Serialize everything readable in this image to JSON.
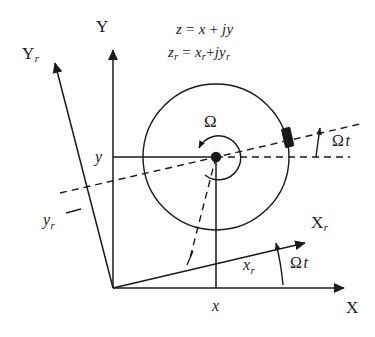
{
  "figure": {
    "background_color": "#ffffff",
    "stroke_color": "#1a1a1a",
    "equations": {
      "line1": {
        "lhs": "z",
        "eq": "=",
        "rhs_real": "x",
        "plus": "+",
        "rhs_imag": "jy"
      },
      "line2": {
        "lhs": "z",
        "lhs_sub": "r",
        "eq": "=",
        "rhs_real": "x",
        "rhs_real_sub": "r",
        "plus": "+",
        "rhs_imag": "jy",
        "rhs_imag_sub": "r"
      }
    },
    "axes": [
      {
        "name": "y-axis",
        "label": "Y",
        "subscript": ""
      },
      {
        "name": "x-axis",
        "label": "X",
        "subscript": ""
      },
      {
        "name": "yr-axis",
        "label": "Y",
        "subscript": "r"
      },
      {
        "name": "xr-axis",
        "label": "X",
        "subscript": "r"
      }
    ],
    "variables": [
      {
        "name": "y-projection",
        "label": "y",
        "subscript": ""
      },
      {
        "name": "x-projection",
        "label": "x",
        "subscript": ""
      },
      {
        "name": "yr-projection",
        "label": "y",
        "subscript": "r"
      },
      {
        "name": "xr-projection",
        "label": "x",
        "subscript": "r"
      }
    ],
    "angular_velocity": {
      "symbol": "Ω"
    },
    "angle_labels": [
      {
        "name": "omega-t-upper",
        "omega": "Ω",
        "t": "t"
      },
      {
        "name": "omega-t-lower",
        "omega": "Ω",
        "t": "t"
      }
    ],
    "geometry": {
      "origin": {
        "x": 113,
        "y": 288
      },
      "circle_center": {
        "x": 216,
        "y": 157
      },
      "circle_radius": 73,
      "rotation_angle_deg": 13
    }
  }
}
